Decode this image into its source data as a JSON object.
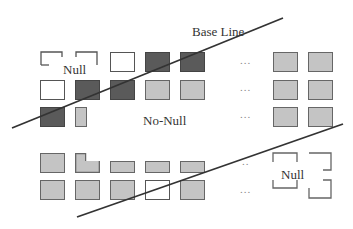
{
  "diagram": {
    "labels": {
      "base_line": "Base Line",
      "null_top": "Null",
      "no_null": "No-Null",
      "null_bottom": "Null",
      "ellipsis": "..."
    },
    "colors": {
      "dark": "#5a5a5a",
      "light": "#c4c4c4",
      "empty": "#ffffff",
      "line": "#333333"
    },
    "grid_top": [
      [
        "bracket",
        "bracket",
        "empty",
        "dark",
        "dark",
        "...",
        "light",
        "light"
      ],
      [
        "empty",
        "dark",
        "dark",
        "light",
        "light",
        "...",
        "light",
        "light"
      ],
      [
        "dark",
        "light-partial",
        "none",
        "none",
        "none",
        "...",
        "light",
        "light"
      ]
    ],
    "grid_bottom": [
      [
        "light",
        "light-notch",
        "light-half",
        "light-half",
        "light-half",
        "..",
        "bracket",
        "bracket"
      ],
      [
        "light",
        "light",
        "light",
        "empty",
        "light",
        "...",
        "bracket",
        "bracket"
      ]
    ],
    "lines": [
      {
        "name": "upper-diagonal",
        "from": [
          12,
          128
        ],
        "to": [
          283,
          20
        ]
      },
      {
        "name": "lower-diagonal",
        "from": [
          77,
          217
        ],
        "to": [
          343,
          125
        ]
      }
    ]
  }
}
